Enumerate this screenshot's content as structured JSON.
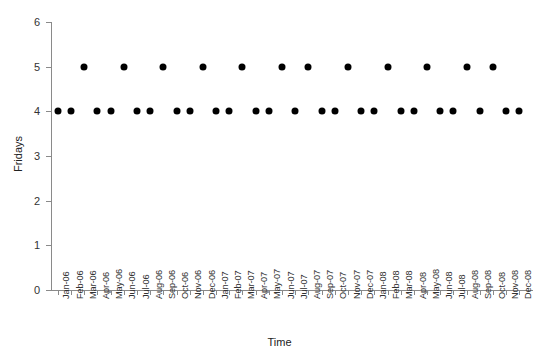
{
  "chart_data": {
    "type": "scatter",
    "title": "",
    "xlabel": "Time",
    "ylabel": "Fridays",
    "ylim": [
      0,
      6
    ],
    "yticks": [
      0,
      1,
      2,
      3,
      4,
      5,
      6
    ],
    "grid": false,
    "legend": null,
    "marker": {
      "shape": "circle",
      "color": "#000000",
      "size_px": 7
    },
    "axis_color": "#8a8a8a",
    "categories": [
      "Jan-06",
      "Feb-06",
      "Mar-06",
      "Apr-06",
      "May-06",
      "Jun-06",
      "Jul-06",
      "Aug-06",
      "Sep-06",
      "Oct-06",
      "Nov-06",
      "Dec-06",
      "Jan-07",
      "Feb-07",
      "Mar-07",
      "Apr-07",
      "May-07",
      "Jun-07",
      "Jul-07",
      "Aug-07",
      "Sep-07",
      "Oct-07",
      "Nov-07",
      "Dec-07",
      "Jan-08",
      "Feb-08",
      "Mar-08",
      "Apr-08",
      "May-08",
      "Jun-08",
      "Jul-08",
      "Aug-08",
      "Sep-08",
      "Oct-08",
      "Nov-08",
      "Dec-08"
    ],
    "values": [
      4,
      4,
      5,
      4,
      4,
      5,
      4,
      4,
      5,
      4,
      4,
      5,
      4,
      4,
      5,
      4,
      4,
      5,
      4,
      5,
      4,
      4,
      5,
      4,
      4,
      5,
      4,
      4,
      5,
      4,
      4,
      5,
      4,
      5,
      4,
      4
    ],
    "series": [
      {
        "name": "Fridays per month",
        "values": [
          4,
          4,
          5,
          4,
          4,
          5,
          4,
          4,
          5,
          4,
          4,
          5,
          4,
          4,
          5,
          4,
          4,
          5,
          4,
          5,
          4,
          4,
          5,
          4,
          4,
          5,
          4,
          4,
          5,
          4,
          4,
          5,
          4,
          5,
          4,
          4
        ]
      }
    ]
  }
}
